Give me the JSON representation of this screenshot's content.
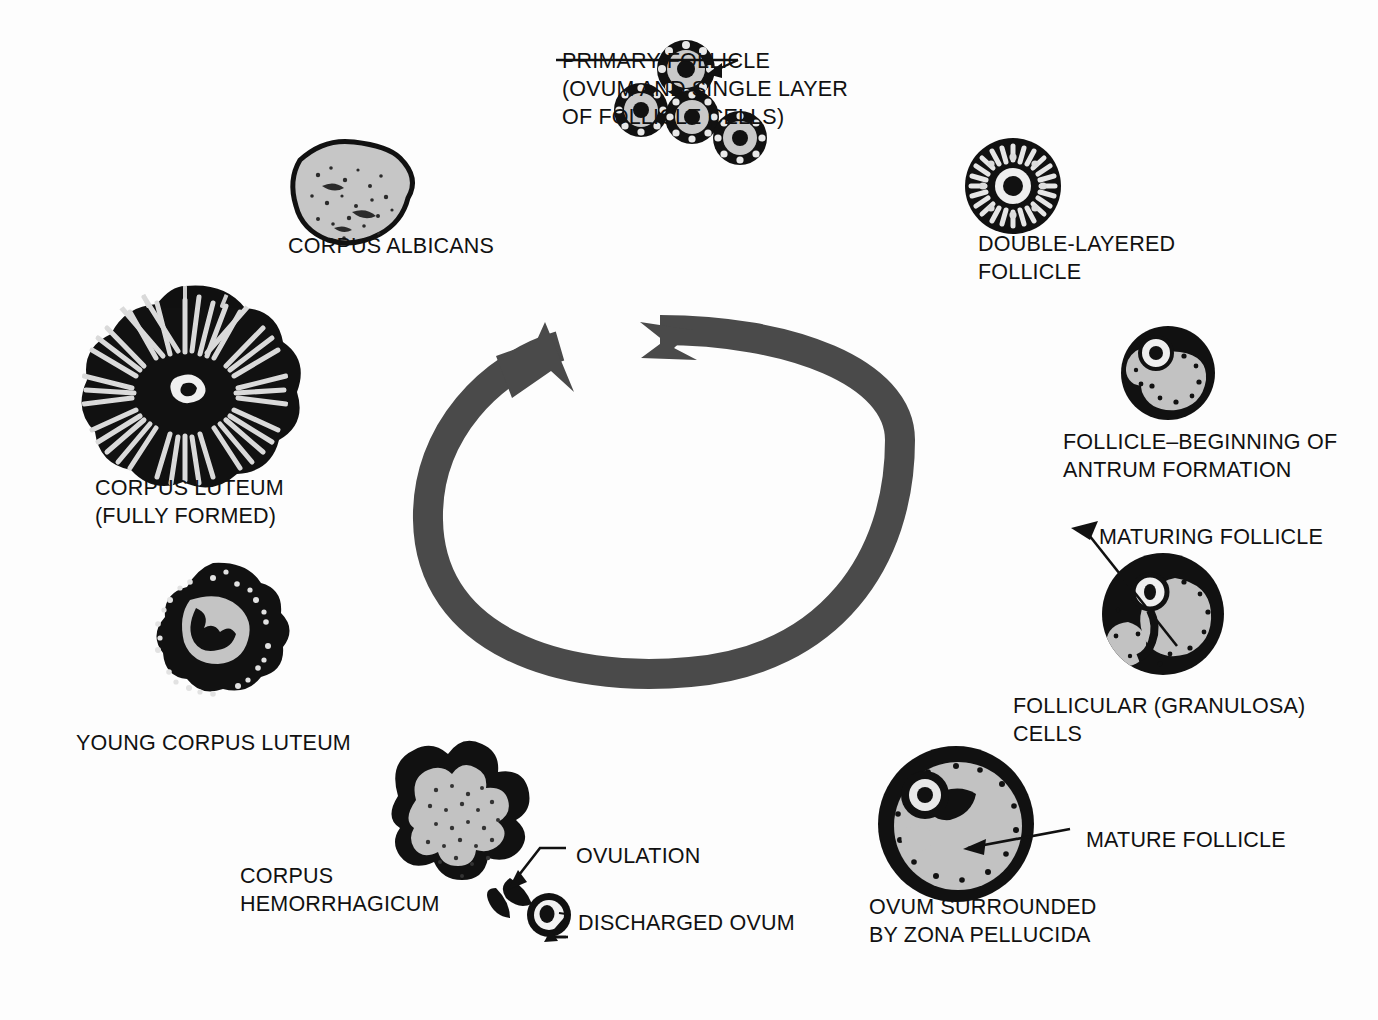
{
  "figure": {
    "kind": "anatomical-diagram",
    "background_color": "#fdfdfd",
    "ink_color": "#111111",
    "arrow_color": "#4a4a4a",
    "fill_gray": "#b9b9b9",
    "fill_gray_light": "#cfcfcf"
  },
  "cycle_arrow": {
    "name": "circular-cycle-arrow",
    "direction": "clockwise",
    "color": "#4a4a4a",
    "gap_position": "top",
    "head_position": "top-left",
    "tail_position": "top-center",
    "tail_style": "notched-ribbon"
  },
  "labels": {
    "primary_follicle": {
      "lines": [
        "PRIMARY FOLLICLE",
        "(OVUM AND SINGLE LAYER",
        "OF FOLLICLE CELLS)"
      ],
      "x": 562,
      "y": 47
    },
    "corpus_albicans": {
      "lines": [
        "CORPUS ALBICANS"
      ],
      "x": 288,
      "y": 232
    },
    "double_layered_follicle": {
      "lines": [
        "DOUBLE-LAYERED",
        "FOLLICLE"
      ],
      "x": 978,
      "y": 230
    },
    "follicle_antrum": {
      "lines": [
        "FOLLICLE–BEGINNING OF",
        "ANTRUM FORMATION"
      ],
      "x": 1063,
      "y": 428
    },
    "corpus_luteum_full": {
      "lines": [
        "CORPUS LUTEUM",
        "(FULLY FORMED)"
      ],
      "x": 95,
      "y": 474
    },
    "maturing_follicle": {
      "lines": [
        "MATURING FOLLICLE"
      ],
      "x": 1099,
      "y": 523
    },
    "follicular_granulosa_cells": {
      "lines": [
        "FOLLICULAR (GRANULOSA)",
        "CELLS"
      ],
      "x": 1013,
      "y": 692
    },
    "young_corpus_luteum": {
      "lines": [
        "YOUNG CORPUS LUTEUM"
      ],
      "x": 76,
      "y": 729
    },
    "mature_follicle": {
      "lines": [
        "MATURE FOLLICLE"
      ],
      "x": 1086,
      "y": 826
    },
    "ovulation": {
      "lines": [
        "OVULATION"
      ],
      "x": 576,
      "y": 842
    },
    "corpus_hemorrhagicum": {
      "lines": [
        "CORPUS",
        "HEMORRHAGICUM"
      ],
      "x": 240,
      "y": 862
    },
    "ovum_zona_pellucida": {
      "lines": [
        "OVUM SURROUNDED",
        "BY ZONA PELLUCIDA"
      ],
      "x": 869,
      "y": 893
    },
    "discharged_ovum": {
      "lines": [
        "DISCHARGED OVUM"
      ],
      "x": 578,
      "y": 909
    }
  },
  "structures": [
    {
      "name": "primary-follicle-cluster",
      "count": 4,
      "cx": 700,
      "cy": 95
    },
    {
      "name": "corpus-albicans",
      "cx": 352,
      "cy": 186
    },
    {
      "name": "double-layered-follicle",
      "cx": 1013,
      "cy": 186
    },
    {
      "name": "follicle-antrum-formation",
      "cx": 1168,
      "cy": 373
    },
    {
      "name": "maturing-follicle",
      "cx": 1163,
      "cy": 614
    },
    {
      "name": "mature-follicle",
      "cx": 956,
      "cy": 824
    },
    {
      "name": "corpus-hemorrhagicum",
      "cx": 470,
      "cy": 832
    },
    {
      "name": "discharged-ovum",
      "cx": 549,
      "cy": 915
    },
    {
      "name": "young-corpus-luteum",
      "cx": 213,
      "cy": 637
    },
    {
      "name": "corpus-luteum-fully-formed",
      "cx": 185,
      "cy": 390
    }
  ]
}
